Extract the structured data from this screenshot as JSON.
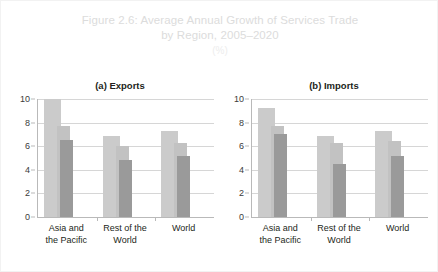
{
  "figure": {
    "title_line1": "Figure 2.6: Average Annual Growth of Services Trade",
    "title_line2": "by Region, 2005–2020",
    "unit": "(%)",
    "title_color": "#dcdcdc",
    "unit_color": "#ededed",
    "background": "#ffffff"
  },
  "colors": {
    "series_light": "#cbcbcb",
    "series_mid": "#c2c2c2",
    "series_dark": "#9a9a9a",
    "axis": "#b9b9b9",
    "grid": "#d6d6d6",
    "text": "#231f20"
  },
  "panels": [
    {
      "key": "exports",
      "title": "(a) Exports"
    },
    {
      "key": "imports",
      "title": "(b) Imports"
    }
  ],
  "axis": {
    "ticks": [
      "0",
      "2",
      "4",
      "6",
      "8",
      "10"
    ],
    "min": 0,
    "max": 10
  },
  "categories": [
    "Asia and\nthe Pacific",
    "Rest of the\nWorld",
    "World"
  ],
  "chart_data": [
    {
      "type": "bar",
      "title": "(a) Exports",
      "categories": [
        "Asia and the Pacific",
        "Rest of the World",
        "World"
      ],
      "series": [
        {
          "name": "series-1",
          "values": [
            10.0,
            6.9,
            7.3
          ]
        },
        {
          "name": "series-2",
          "values": [
            7.7,
            6.0,
            6.3
          ]
        },
        {
          "name": "series-3",
          "values": [
            6.5,
            4.8,
            5.2
          ]
        }
      ],
      "xlabel": "",
      "ylabel": "",
      "ylim": [
        0,
        10
      ],
      "yticks": [
        0,
        2,
        4,
        6,
        8,
        10
      ],
      "grid": true,
      "legend": "none"
    },
    {
      "type": "bar",
      "title": "(b) Imports",
      "categories": [
        "Asia and the Pacific",
        "Rest of the World",
        "World"
      ],
      "series": [
        {
          "name": "series-1",
          "values": [
            9.2,
            6.9,
            7.3
          ]
        },
        {
          "name": "series-2",
          "values": [
            7.7,
            6.3,
            6.4
          ]
        },
        {
          "name": "series-3",
          "values": [
            7.0,
            4.5,
            5.2
          ]
        }
      ],
      "xlabel": "",
      "ylabel": "",
      "ylim": [
        0,
        10
      ],
      "yticks": [
        0,
        2,
        4,
        6,
        8,
        10
      ],
      "grid": true,
      "legend": "none"
    }
  ]
}
